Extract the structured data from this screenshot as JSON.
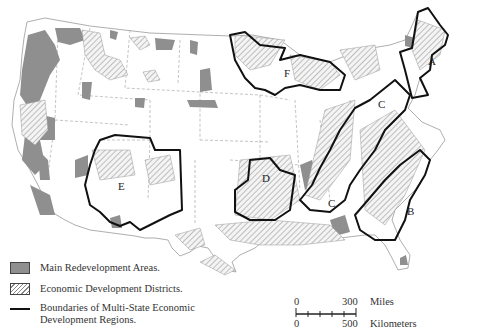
{
  "map": {
    "subject": "United States economic development areas and multi-state economic development regions",
    "region_labels": [
      "A",
      "B",
      "C",
      "C",
      "D",
      "E",
      "F"
    ],
    "colors": {
      "redevelopment_fill": "#8f8f8f",
      "district_hatch": "#888888",
      "boundary": "#111111",
      "state_line": "#999999"
    }
  },
  "legend": {
    "items": [
      {
        "symbol": "solid-gray",
        "label": "Main Redevelopment Areas."
      },
      {
        "symbol": "hatched",
        "label": "Economic Development Districts."
      },
      {
        "symbol": "black-line",
        "label": "Boundaries of Multi-State Economic",
        "label_line2": "Development Regions."
      }
    ]
  },
  "scale_bar": {
    "miles": {
      "start": "0",
      "end": "300",
      "unit": "Miles"
    },
    "kilometers": {
      "start": "0",
      "end": "500",
      "unit": "Kilometers"
    }
  }
}
